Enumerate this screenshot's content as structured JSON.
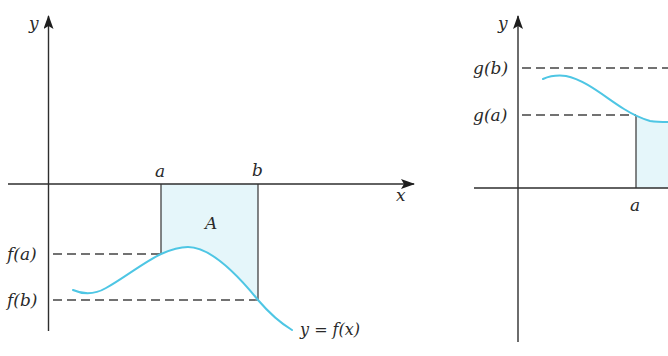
{
  "left_panel": {
    "axes": {
      "y_label": "y",
      "x_label": "x"
    },
    "x_ticks": {
      "a": "a",
      "b": "b"
    },
    "y_ticks": {
      "fa": "f(a)",
      "fb": "f(b)"
    },
    "region_label": "A",
    "curve_label": "y = f(x)"
  },
  "right_panel": {
    "axes": {
      "y_label": "y"
    },
    "x_ticks": {
      "a": "a"
    },
    "y_ticks": {
      "gb": "g(b)",
      "ga": "g(a)"
    }
  },
  "colors": {
    "curve": "#4ec6e4",
    "region_fill": "#e5f6fa",
    "axis": "#2e2e2e"
  }
}
